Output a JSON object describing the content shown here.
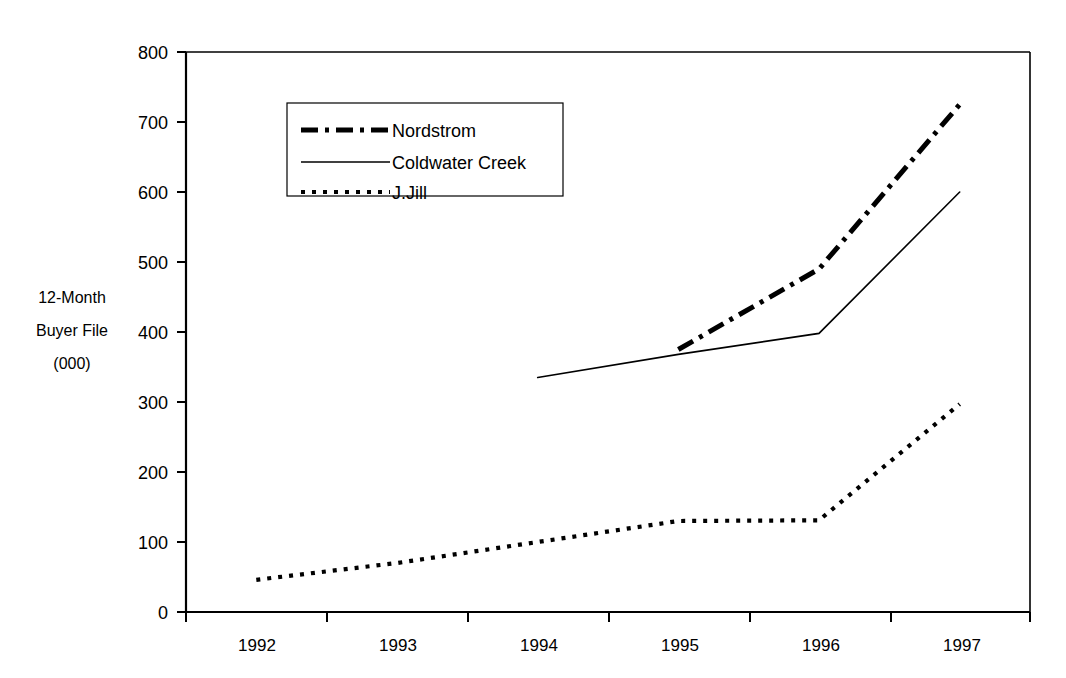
{
  "chart_data": {
    "type": "line",
    "title": "",
    "subtitle": "",
    "xlabel": "",
    "ylabel": "12-Month Buyer File (000)",
    "ylabel_lines": [
      "12-Month",
      "Buyer File",
      "(000)"
    ],
    "categories": [
      "1992",
      "1993",
      "1994",
      "1995",
      "1996",
      "1997"
    ],
    "xlim": [
      "1992",
      "1997"
    ],
    "ylim": [
      0,
      800
    ],
    "y_ticks": [
      0,
      100,
      200,
      300,
      400,
      500,
      600,
      700,
      800
    ],
    "y_tick_labels": [
      "0",
      "100",
      "200",
      "300",
      "400",
      "500",
      "600",
      "700",
      "800"
    ],
    "grid": false,
    "legend_position": "upper-left-inside",
    "series": [
      {
        "name": "Nordstrom",
        "style": "dash-dot",
        "color": "#000000",
        "x": [
          "1995",
          "1996",
          "1997"
        ],
        "values": [
          375,
          490,
          725
        ]
      },
      {
        "name": "Coldwater Creek",
        "style": "solid",
        "color": "#000000",
        "x": [
          "1994",
          "1995",
          "1996",
          "1997"
        ],
        "values": [
          335,
          368,
          398,
          600
        ]
      },
      {
        "name": "J.Jill",
        "style": "dotted",
        "color": "#000000",
        "x": [
          "1992",
          "1993",
          "1994",
          "1995",
          "1996",
          "1997"
        ],
        "values": [
          46,
          70,
          100,
          130,
          131,
          297
        ]
      }
    ]
  },
  "axis": {
    "y_labels": [
      "800",
      "700",
      "600",
      "500",
      "400",
      "300",
      "200",
      "100",
      "0"
    ],
    "x_labels": [
      "1992",
      "1993",
      "1994",
      "1995",
      "1996",
      "1997"
    ],
    "y_title": {
      "line1": "12-Month",
      "line2": "Buyer File",
      "line3": "(000)"
    }
  },
  "legend": {
    "items": [
      {
        "label": "Nordstrom",
        "style": "dash-dot"
      },
      {
        "label": "Coldwater Creek",
        "style": "solid"
      },
      {
        "label": "J.Jill",
        "style": "dotted"
      }
    ]
  },
  "colors": {
    "ink": "#000000",
    "background": "#ffffff"
  }
}
